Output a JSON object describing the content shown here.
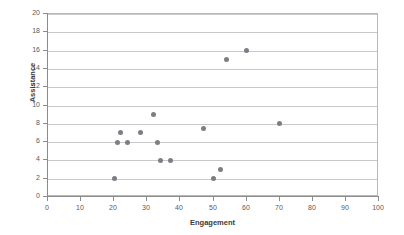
{
  "chart_data": {
    "type": "scatter",
    "title": "",
    "xlabel": "Engagement",
    "ylabel": "Assistance",
    "xlim": [
      0,
      100
    ],
    "ylim": [
      0,
      20
    ],
    "xticks": [
      0,
      10,
      20,
      30,
      40,
      50,
      60,
      70,
      80,
      90,
      100
    ],
    "yticks": [
      0,
      2,
      4,
      6,
      8,
      10,
      12,
      14,
      16,
      18,
      20
    ],
    "grid": "horizontal",
    "legend": "none",
    "marker_color": "#7d7d85",
    "series": [
      {
        "name": "Assistance vs Engagement",
        "points": [
          {
            "x": 20,
            "y": 2
          },
          {
            "x": 21,
            "y": 6
          },
          {
            "x": 22,
            "y": 7
          },
          {
            "x": 24,
            "y": 6
          },
          {
            "x": 28,
            "y": 7
          },
          {
            "x": 32,
            "y": 9
          },
          {
            "x": 33,
            "y": 6
          },
          {
            "x": 34,
            "y": 4
          },
          {
            "x": 37,
            "y": 4
          },
          {
            "x": 47,
            "y": 7.5
          },
          {
            "x": 50,
            "y": 2
          },
          {
            "x": 52,
            "y": 3
          },
          {
            "x": 54,
            "y": 15
          },
          {
            "x": 60,
            "y": 16
          },
          {
            "x": 70,
            "y": 8
          }
        ]
      }
    ]
  },
  "colors": {
    "marker": "#7d7d85",
    "gridline": "#c8c8c8",
    "axis": "#8c8c8c",
    "frame": "#b9b9b9",
    "tick_label": "#5a5a5a",
    "axis_title": "#3a3a3a",
    "background": "#ffffff"
  }
}
